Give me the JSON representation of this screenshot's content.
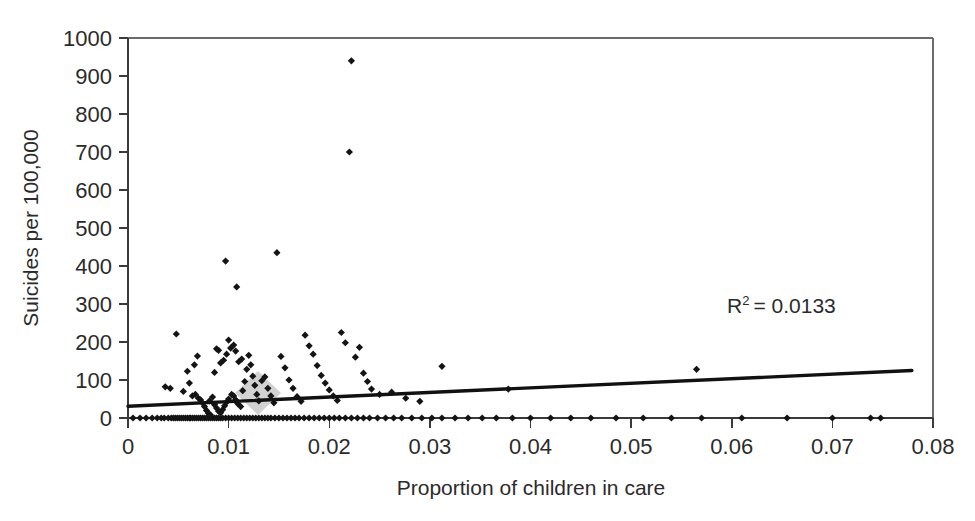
{
  "figure": {
    "title": "",
    "background_color": "#ffffff",
    "marker_color": "#141414",
    "trendline_color": "#111111",
    "axis_color": "#3a3a3a"
  },
  "labels": {
    "ylabel": "Suicides per 100,000",
    "xlabel": "Proportion of children in care",
    "r2_prefix": "R",
    "r2_superscript": "2",
    "r2_value": "= 0.0133",
    "r2_full": "R² = 0.0133"
  },
  "axes": {
    "y_ticks": [
      "0",
      "100",
      "200",
      "300",
      "400",
      "500",
      "600",
      "700",
      "800",
      "900",
      "1000"
    ],
    "x_ticks": [
      "0",
      "0.01",
      "0.02",
      "0.03",
      "0.04",
      "0.05",
      "0.06",
      "0.07",
      "0.08"
    ]
  },
  "chart_data": {
    "type": "scatter",
    "title": "",
    "xlabel": "Proportion of children in care",
    "ylabel": "Suicides per 100,000",
    "xlim": [
      0,
      0.08
    ],
    "ylim": [
      0,
      1000
    ],
    "xticks": [
      0,
      0.01,
      0.02,
      0.03,
      0.04,
      0.05,
      0.06,
      0.07,
      0.08
    ],
    "yticks": [
      0,
      100,
      200,
      300,
      400,
      500,
      600,
      700,
      800,
      900,
      1000
    ],
    "grid": false,
    "legend": false,
    "annotations": [
      {
        "text": "R² = 0.0133",
        "x": 0.0675,
        "y": 300
      }
    ],
    "trendline": {
      "type": "linear",
      "x_start": 0.0,
      "y_start": 31,
      "x_end": 0.0779,
      "y_end": 125,
      "r_squared": 0.0133
    },
    "marker": {
      "shape": "diamond",
      "size": 6,
      "color": "#141414"
    },
    "series": [
      {
        "name": "Local authorities",
        "points": [
          [
            0.0005,
            0
          ],
          [
            0.0012,
            0
          ],
          [
            0.0018,
            0
          ],
          [
            0.0024,
            0
          ],
          [
            0.0029,
            0
          ],
          [
            0.0033,
            0
          ],
          [
            0.0036,
            0
          ],
          [
            0.004,
            0
          ],
          [
            0.0043,
            0
          ],
          [
            0.0045,
            0
          ],
          [
            0.0047,
            0
          ],
          [
            0.0049,
            0
          ],
          [
            0.0051,
            0
          ],
          [
            0.0053,
            0
          ],
          [
            0.0055,
            0
          ],
          [
            0.0057,
            0
          ],
          [
            0.0059,
            0
          ],
          [
            0.0061,
            0
          ],
          [
            0.0062,
            0
          ],
          [
            0.0064,
            0
          ],
          [
            0.0066,
            0
          ],
          [
            0.0068,
            0
          ],
          [
            0.007,
            0
          ],
          [
            0.0072,
            0
          ],
          [
            0.0074,
            0
          ],
          [
            0.0076,
            0
          ],
          [
            0.0078,
            0
          ],
          [
            0.008,
            0
          ],
          [
            0.0082,
            0
          ],
          [
            0.0084,
            0
          ],
          [
            0.0086,
            0
          ],
          [
            0.0088,
            0
          ],
          [
            0.009,
            0
          ],
          [
            0.0092,
            0
          ],
          [
            0.0094,
            0
          ],
          [
            0.0097,
            0
          ],
          [
            0.01,
            0
          ],
          [
            0.0103,
            0
          ],
          [
            0.0106,
            0
          ],
          [
            0.0109,
            0
          ],
          [
            0.0112,
            0
          ],
          [
            0.0115,
            0
          ],
          [
            0.0118,
            0
          ],
          [
            0.0121,
            0
          ],
          [
            0.0124,
            0
          ],
          [
            0.0127,
            0
          ],
          [
            0.013,
            0
          ],
          [
            0.0133,
            0
          ],
          [
            0.0136,
            0
          ],
          [
            0.0139,
            0
          ],
          [
            0.0142,
            0
          ],
          [
            0.0146,
            0
          ],
          [
            0.015,
            0
          ],
          [
            0.0154,
            0
          ],
          [
            0.0158,
            0
          ],
          [
            0.0162,
            0
          ],
          [
            0.0166,
            0
          ],
          [
            0.017,
            0
          ],
          [
            0.0175,
            0
          ],
          [
            0.018,
            0
          ],
          [
            0.0185,
            0
          ],
          [
            0.019,
            0
          ],
          [
            0.0195,
            0
          ],
          [
            0.02,
            0
          ],
          [
            0.0205,
            0
          ],
          [
            0.021,
            0
          ],
          [
            0.0216,
            0
          ],
          [
            0.0222,
            0
          ],
          [
            0.0228,
            0
          ],
          [
            0.0234,
            0
          ],
          [
            0.024,
            0
          ],
          [
            0.0248,
            0
          ],
          [
            0.0256,
            0
          ],
          [
            0.0264,
            0
          ],
          [
            0.0272,
            0
          ],
          [
            0.0282,
            0
          ],
          [
            0.0292,
            0
          ],
          [
            0.0302,
            0
          ],
          [
            0.0312,
            0
          ],
          [
            0.0325,
            0
          ],
          [
            0.0338,
            0
          ],
          [
            0.0352,
            0
          ],
          [
            0.0366,
            0
          ],
          [
            0.0382,
            0
          ],
          [
            0.04,
            0
          ],
          [
            0.042,
            0
          ],
          [
            0.044,
            0
          ],
          [
            0.046,
            0
          ],
          [
            0.0485,
            0
          ],
          [
            0.0512,
            0
          ],
          [
            0.054,
            0
          ],
          [
            0.057,
            0
          ],
          [
            0.061,
            0
          ],
          [
            0.0655,
            0
          ],
          [
            0.07,
            0
          ],
          [
            0.0738,
            0
          ],
          [
            0.0748,
            0
          ],
          [
            0.0037,
            82
          ],
          [
            0.0042,
            78
          ],
          [
            0.0048,
            221
          ],
          [
            0.0055,
            70
          ],
          [
            0.0061,
            92
          ],
          [
            0.0064,
            58
          ],
          [
            0.0067,
            62
          ],
          [
            0.007,
            52
          ],
          [
            0.0072,
            48
          ],
          [
            0.0074,
            40
          ],
          [
            0.0076,
            30
          ],
          [
            0.0078,
            20
          ],
          [
            0.008,
            12
          ],
          [
            0.0082,
            8
          ],
          [
            0.0069,
            163
          ],
          [
            0.0066,
            140
          ],
          [
            0.0059,
            123
          ],
          [
            0.0081,
            45
          ],
          [
            0.0084,
            55
          ],
          [
            0.0086,
            35
          ],
          [
            0.0088,
            26
          ],
          [
            0.009,
            18
          ],
          [
            0.0092,
            14
          ],
          [
            0.0094,
            22
          ],
          [
            0.0096,
            32
          ],
          [
            0.0098,
            42
          ],
          [
            0.01,
            50
          ],
          [
            0.0097,
            413
          ],
          [
            0.0103,
            62
          ],
          [
            0.0105,
            58
          ],
          [
            0.0107,
            48
          ],
          [
            0.0109,
            38
          ],
          [
            0.0112,
            30
          ],
          [
            0.0114,
            72
          ],
          [
            0.0116,
            96
          ],
          [
            0.0118,
            128
          ],
          [
            0.0113,
            155
          ],
          [
            0.011,
            148
          ],
          [
            0.0107,
            176
          ],
          [
            0.0105,
            192
          ],
          [
            0.0102,
            184
          ],
          [
            0.01,
            205
          ],
          [
            0.0108,
            345
          ],
          [
            0.0098,
            168
          ],
          [
            0.0095,
            152
          ],
          [
            0.0092,
            145
          ],
          [
            0.009,
            178
          ],
          [
            0.0088,
            182
          ],
          [
            0.0086,
            120
          ],
          [
            0.012,
            165
          ],
          [
            0.0122,
            140
          ],
          [
            0.0124,
            110
          ],
          [
            0.0126,
            86
          ],
          [
            0.0128,
            62
          ],
          [
            0.013,
            45
          ],
          [
            0.0133,
            98
          ],
          [
            0.0136,
            108
          ],
          [
            0.0139,
            78
          ],
          [
            0.0142,
            58
          ],
          [
            0.0145,
            40
          ],
          [
            0.0148,
            435
          ],
          [
            0.0152,
            162
          ],
          [
            0.0156,
            132
          ],
          [
            0.016,
            100
          ],
          [
            0.0164,
            78
          ],
          [
            0.0168,
            56
          ],
          [
            0.0172,
            44
          ],
          [
            0.0176,
            218
          ],
          [
            0.018,
            190
          ],
          [
            0.0184,
            168
          ],
          [
            0.0188,
            138
          ],
          [
            0.0192,
            112
          ],
          [
            0.0196,
            92
          ],
          [
            0.02,
            74
          ],
          [
            0.0204,
            58
          ],
          [
            0.0208,
            46
          ],
          [
            0.0212,
            225
          ],
          [
            0.0216,
            198
          ],
          [
            0.022,
            700
          ],
          [
            0.0222,
            940
          ],
          [
            0.0226,
            160
          ],
          [
            0.023,
            186
          ],
          [
            0.0234,
            118
          ],
          [
            0.0238,
            96
          ],
          [
            0.0242,
            76
          ],
          [
            0.025,
            62
          ],
          [
            0.0262,
            68
          ],
          [
            0.0276,
            52
          ],
          [
            0.029,
            44
          ],
          [
            0.0312,
            136
          ],
          [
            0.0378,
            76
          ],
          [
            0.0565,
            128
          ]
        ]
      }
    ]
  },
  "watermark": {
    "shape": "diamond",
    "color": "#d2d2d2"
  }
}
